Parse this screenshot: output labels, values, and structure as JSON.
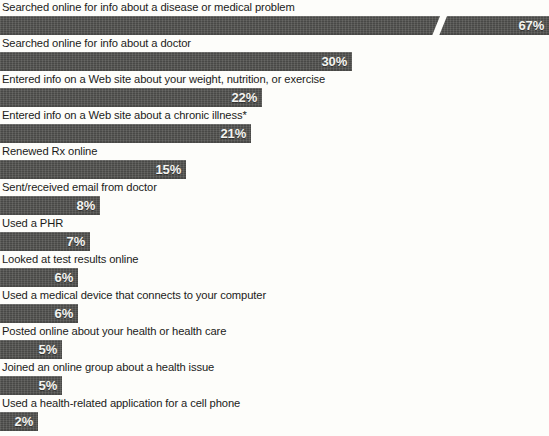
{
  "chart_data": {
    "type": "bar",
    "orientation": "horizontal",
    "title": "",
    "subtitle": "",
    "xlabel": "",
    "ylabel": "",
    "grid": false,
    "legend": null,
    "axis_break": {
      "present": true,
      "on_category": "Searched online for info about a disease or medical problem",
      "note": "diagonal break mark drawn across the longest bar"
    },
    "value_suffix": "%",
    "xlim": [
      0,
      67
    ],
    "categories": [
      "Searched online for info about a disease or medical problem",
      "Searched online for info about a doctor",
      "Entered info on a Web site about your weight, nutrition, or exercise",
      "Entered info on a Web site about a chronic illness*",
      "Renewed Rx online",
      "Sent/received email from doctor",
      "Used a PHR",
      "Looked at test results online",
      "Used a medical device that connects to your computer",
      "Posted online about your health or health care",
      "Joined an online group about a health issue",
      "Used a health-related application for a cell phone"
    ],
    "values": [
      67,
      30,
      22,
      21,
      15,
      8,
      7,
      6,
      6,
      5,
      5,
      2
    ],
    "value_labels": [
      "67%",
      "30%",
      "22%",
      "21%",
      "15%",
      "8%",
      "7%",
      "6%",
      "6%",
      "5%",
      "5%",
      "2%"
    ],
    "bar_pixel_widths": [
      549,
      352,
      262,
      251,
      186,
      100,
      90,
      78,
      78,
      62,
      62,
      38
    ],
    "colors": {
      "bar_fill": "#4d4d4a",
      "value_text": "#f4f4f0",
      "label_text": "#1b1b19",
      "background": "#fdfdfa"
    }
  },
  "rows": [
    {
      "label": "Searched online for info about a disease or medical problem",
      "value_label": "67%",
      "width": 549,
      "has_break": true
    },
    {
      "label": "Searched online for info about a doctor",
      "value_label": "30%",
      "width": 352,
      "has_break": false
    },
    {
      "label": "Entered info on a Web site about your weight, nutrition, or exercise",
      "value_label": "22%",
      "width": 262,
      "has_break": false
    },
    {
      "label": "Entered info on a Web site about a chronic illness*",
      "value_label": "21%",
      "width": 251,
      "has_break": false
    },
    {
      "label": "Renewed Rx online",
      "value_label": "15%",
      "width": 186,
      "has_break": false
    },
    {
      "label": "Sent/received email from doctor",
      "value_label": "8%",
      "width": 100,
      "has_break": false
    },
    {
      "label": "Used a PHR",
      "value_label": "7%",
      "width": 90,
      "has_break": false
    },
    {
      "label": "Looked at test results online",
      "value_label": "6%",
      "width": 78,
      "has_break": false
    },
    {
      "label": "Used a medical device that connects to your computer",
      "value_label": "6%",
      "width": 78,
      "has_break": false
    },
    {
      "label": "Posted online about your health or health care",
      "value_label": "5%",
      "width": 62,
      "has_break": false
    },
    {
      "label": "Joined an online group about a health issue",
      "value_label": "5%",
      "width": 62,
      "has_break": false
    },
    {
      "label": "Used a health-related application for a cell phone",
      "value_label": "2%",
      "width": 38,
      "has_break": false
    }
  ]
}
